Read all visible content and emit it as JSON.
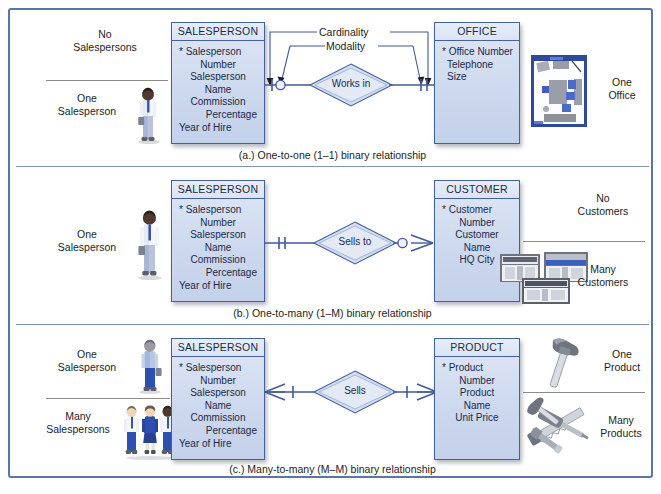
{
  "figure": {
    "frame_color": "#5b74ab",
    "entity_fill": "#cdd9ee",
    "entity_border": "#45609e",
    "line_color": "#42589a"
  },
  "annotations": {
    "cardinality": "Cardinality",
    "modality": "Modality"
  },
  "panels": [
    {
      "id": "a",
      "caption": "(a.) One-to-one (1–1) binary relationship",
      "left_labels": [
        {
          "text_line1": "No",
          "text_line2": "Salespersons"
        },
        {
          "text_line1": "One",
          "text_line2": "Salesperson"
        }
      ],
      "left_entity": {
        "name": "SALESPERSON",
        "attributes": [
          "* Salesperson",
          "Number",
          "Salesperson",
          "Name",
          "Commission",
          "Percentage",
          "Year of Hire"
        ]
      },
      "relationship": "Works in",
      "right_entity": {
        "name": "OFFICE",
        "attributes": [
          "* Office Number",
          "Telephone",
          "Size"
        ]
      },
      "right_labels": [
        {
          "text_line1": "One",
          "text_line2": "Office"
        }
      ],
      "left_connector": {
        "modality": "optional-zero",
        "cardinality": "one"
      },
      "right_connector": {
        "modality": "mandatory-one",
        "cardinality": "one"
      },
      "left_art": "one-salesperson-figure",
      "right_art": "office-floorplan"
    },
    {
      "id": "b",
      "caption": "(b.) One-to-many (1–M) binary relationship",
      "left_labels": [
        {
          "text_line1": "One",
          "text_line2": "Salesperson"
        }
      ],
      "left_entity": {
        "name": "SALESPERSON",
        "attributes": [
          "* Salesperson",
          "Number",
          "Salesperson",
          "Name",
          "Commission",
          "Percentage",
          "Year of Hire"
        ]
      },
      "relationship": "Sells to",
      "right_entity": {
        "name": "CUSTOMER",
        "attributes": [
          "* Customer",
          "Number",
          "Customer",
          "Name",
          "HQ City"
        ]
      },
      "right_labels": [
        {
          "text_line1": "No",
          "text_line2": "Customers"
        },
        {
          "text_line1": "Many",
          "text_line2": "Customers"
        }
      ],
      "left_connector": {
        "modality": "mandatory-one",
        "cardinality": "one"
      },
      "right_connector": {
        "modality": "optional-zero",
        "cardinality": "many"
      },
      "left_art": "one-salesperson-figure",
      "right_art": "three-storefronts"
    },
    {
      "id": "c",
      "caption": "(c.) Many-to-many (M–M) binary relationship",
      "left_labels": [
        {
          "text_line1": "One",
          "text_line2": "Salesperson"
        },
        {
          "text_line1": "Many",
          "text_line2": "Salespersons"
        }
      ],
      "left_entity": {
        "name": "SALESPERSON",
        "attributes": [
          "* Salesperson",
          "Number",
          "Salesperson",
          "Name",
          "Commission",
          "Percentage",
          "Year of Hire"
        ]
      },
      "relationship": "Sells",
      "right_entity": {
        "name": "PRODUCT",
        "attributes": [
          "* Product",
          "Number",
          "Product",
          "Name",
          "Unit Price"
        ]
      },
      "right_labels": [
        {
          "text_line1": "One",
          "text_line2": "Product"
        },
        {
          "text_line1": "Many",
          "text_line2": "Products"
        }
      ],
      "left_connector": {
        "modality": "mandatory-one",
        "cardinality": "many"
      },
      "right_connector": {
        "modality": "mandatory-one",
        "cardinality": "many"
      },
      "left_art": "salespersons-figures",
      "right_art": "tools"
    }
  ]
}
